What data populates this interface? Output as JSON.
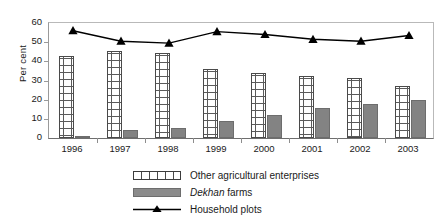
{
  "chart": {
    "ylabel": "Per cent",
    "ytick_labels": [
      "60",
      "50",
      "40",
      "30",
      "20",
      "10",
      "0"
    ]
  },
  "legend": {
    "position": "bottom",
    "items": [
      {
        "label": "Other agricultural enterprises",
        "swatch": "grid-pattern-swatch",
        "color": "#ffffff"
      },
      {
        "label_pre": "Dekhan",
        "label_post": " farms",
        "label": "Dekhan farms",
        "swatch": "solid-gray-swatch",
        "color": "#838383"
      },
      {
        "label": "Household plots",
        "swatch": "line-triangle-swatch",
        "color": "#000000"
      }
    ]
  },
  "chart_data": {
    "type": "bar",
    "title": "",
    "xlabel": "",
    "ylabel": "Per cent",
    "ylim": [
      0,
      60
    ],
    "yticks": [
      0,
      10,
      20,
      30,
      40,
      50,
      60
    ],
    "grid": false,
    "legend_position": "bottom",
    "categories": [
      "1996",
      "1997",
      "1998",
      "1999",
      "2000",
      "2001",
      "2002",
      "2003"
    ],
    "series": [
      {
        "name": "Other agricultural enterprises",
        "type": "bar",
        "style": "grid-hatch",
        "color": "#ffffff",
        "values": [
          43,
          45.5,
          44.5,
          36,
          34,
          32.5,
          31.5,
          27
        ]
      },
      {
        "name": "Dekhan farms",
        "type": "bar",
        "style": "solid",
        "color": "#838383",
        "values": [
          1,
          4,
          5,
          9,
          12,
          15.5,
          18,
          20
        ]
      },
      {
        "name": "Household plots",
        "type": "line",
        "marker": "triangle",
        "color": "#000000",
        "values": [
          56,
          50.5,
          49.5,
          55.5,
          54,
          51.5,
          50.5,
          53.5
        ]
      }
    ]
  }
}
